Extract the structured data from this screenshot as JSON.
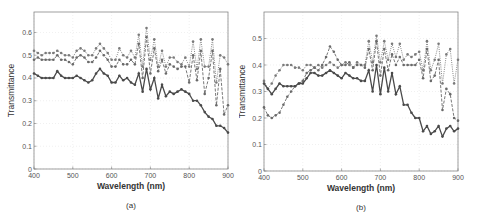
{
  "chart_data": [
    {
      "id": "a",
      "type": "line",
      "caption": "(a)",
      "title": "",
      "xlabel": "Wavelength (nm)",
      "ylabel": "Transmittance",
      "xlim": [
        400,
        900
      ],
      "ylim": [
        0,
        0.69
      ],
      "xticks": [
        400,
        500,
        600,
        700,
        800,
        900
      ],
      "yticks": [
        0,
        0.1,
        0.2,
        0.3,
        0.4,
        0.5,
        0.6
      ],
      "ytick_labels": [
        "0",
        "0.1",
        "0.2",
        "0.3",
        "0.4",
        "0.5",
        "0.6"
      ],
      "grid": true,
      "legend": null,
      "x": [
        400,
        410,
        420,
        430,
        440,
        450,
        460,
        470,
        480,
        490,
        500,
        510,
        520,
        530,
        540,
        550,
        560,
        570,
        580,
        590,
        600,
        610,
        620,
        630,
        640,
        650,
        660,
        670,
        680,
        690,
        700,
        710,
        720,
        730,
        740,
        750,
        760,
        770,
        780,
        790,
        800,
        810,
        820,
        830,
        840,
        850,
        860,
        870,
        880,
        890,
        900
      ],
      "series": [
        {
          "name": "series-1",
          "style": "dotted",
          "values": [
            0.52,
            0.51,
            0.5,
            0.51,
            0.51,
            0.51,
            0.52,
            0.51,
            0.5,
            0.5,
            0.49,
            0.52,
            0.53,
            0.52,
            0.5,
            0.5,
            0.53,
            0.55,
            0.53,
            0.51,
            0.48,
            0.48,
            0.53,
            0.5,
            0.49,
            0.52,
            0.49,
            0.59,
            0.45,
            0.62,
            0.48,
            0.57,
            0.45,
            0.52,
            0.45,
            0.49,
            0.49,
            0.47,
            0.46,
            0.49,
            0.45,
            0.56,
            0.44,
            0.57,
            0.45,
            0.45,
            0.57,
            0.38,
            0.5,
            0.49,
            0.46
          ]
        },
        {
          "name": "series-2",
          "style": "dashed",
          "values": [
            0.48,
            0.49,
            0.48,
            0.48,
            0.48,
            0.48,
            0.5,
            0.48,
            0.48,
            0.47,
            0.46,
            0.49,
            0.5,
            0.49,
            0.47,
            0.47,
            0.49,
            0.52,
            0.5,
            0.48,
            0.45,
            0.45,
            0.48,
            0.46,
            0.46,
            0.48,
            0.46,
            0.55,
            0.4,
            0.58,
            0.42,
            0.53,
            0.43,
            0.48,
            0.42,
            0.46,
            0.45,
            0.44,
            0.45,
            0.45,
            0.38,
            0.5,
            0.39,
            0.52,
            0.33,
            0.4,
            0.52,
            0.28,
            0.44,
            0.24,
            0.28
          ]
        },
        {
          "name": "series-3",
          "style": "solid",
          "values": [
            0.42,
            0.41,
            0.4,
            0.4,
            0.4,
            0.4,
            0.43,
            0.41,
            0.4,
            0.4,
            0.4,
            0.41,
            0.4,
            0.39,
            0.38,
            0.39,
            0.42,
            0.44,
            0.42,
            0.41,
            0.38,
            0.38,
            0.41,
            0.39,
            0.4,
            0.38,
            0.37,
            0.42,
            0.34,
            0.44,
            0.35,
            0.4,
            0.31,
            0.37,
            0.32,
            0.34,
            0.33,
            0.34,
            0.35,
            0.34,
            0.33,
            0.3,
            0.3,
            0.28,
            0.25,
            0.23,
            0.22,
            0.19,
            0.19,
            0.18,
            0.16
          ]
        }
      ]
    },
    {
      "id": "b",
      "type": "line",
      "caption": "(b)",
      "title": "",
      "xlabel": "Wavelength (nm)",
      "ylabel": "Transmittance",
      "xlim": [
        400,
        900
      ],
      "ylim": [
        0,
        0.6
      ],
      "xticks": [
        400,
        500,
        600,
        700,
        800,
        900
      ],
      "yticks": [
        0,
        0.1,
        0.2,
        0.3,
        0.4,
        0.5
      ],
      "ytick_labels": [
        "0",
        "0.1",
        "0.2",
        "0.3",
        "0.4",
        "0.5"
      ],
      "grid": true,
      "legend": null,
      "x": [
        400,
        410,
        420,
        430,
        440,
        450,
        460,
        470,
        480,
        490,
        500,
        510,
        520,
        530,
        540,
        550,
        560,
        570,
        580,
        590,
        600,
        610,
        620,
        630,
        640,
        650,
        660,
        670,
        680,
        690,
        700,
        710,
        720,
        730,
        740,
        750,
        760,
        770,
        780,
        790,
        800,
        810,
        820,
        830,
        840,
        850,
        860,
        870,
        880,
        890,
        900
      ],
      "series": [
        {
          "name": "series-1",
          "style": "dotted",
          "values": [
            0.34,
            0.31,
            0.33,
            0.36,
            0.38,
            0.4,
            0.4,
            0.4,
            0.39,
            0.39,
            0.38,
            0.4,
            0.4,
            0.39,
            0.4,
            0.39,
            0.4,
            0.41,
            0.4,
            0.39,
            0.4,
            0.41,
            0.4,
            0.39,
            0.41,
            0.4,
            0.4,
            0.49,
            0.41,
            0.51,
            0.41,
            0.49,
            0.42,
            0.48,
            0.43,
            0.48,
            0.42,
            0.44,
            0.43,
            0.44,
            0.45,
            0.38,
            0.49,
            0.38,
            0.42,
            0.48,
            0.33,
            0.44,
            0.46,
            0.33,
            0.42
          ]
        },
        {
          "name": "series-2",
          "style": "dashed",
          "values": [
            0.24,
            0.21,
            0.2,
            0.21,
            0.22,
            0.25,
            0.28,
            0.3,
            0.32,
            0.33,
            0.34,
            0.37,
            0.38,
            0.39,
            0.38,
            0.4,
            0.43,
            0.47,
            0.45,
            0.42,
            0.4,
            0.4,
            0.41,
            0.39,
            0.4,
            0.4,
            0.39,
            0.46,
            0.38,
            0.49,
            0.36,
            0.46,
            0.38,
            0.44,
            0.4,
            0.43,
            0.4,
            0.4,
            0.4,
            0.4,
            0.42,
            0.35,
            0.46,
            0.34,
            0.36,
            0.42,
            0.23,
            0.31,
            0.29,
            0.2,
            0.19
          ]
        },
        {
          "name": "series-3",
          "style": "solid",
          "values": [
            0.33,
            0.31,
            0.29,
            0.31,
            0.33,
            0.32,
            0.32,
            0.32,
            0.32,
            0.33,
            0.33,
            0.35,
            0.37,
            0.37,
            0.36,
            0.36,
            0.37,
            0.38,
            0.37,
            0.36,
            0.35,
            0.37,
            0.36,
            0.35,
            0.35,
            0.34,
            0.34,
            0.38,
            0.3,
            0.4,
            0.29,
            0.39,
            0.3,
            0.37,
            0.29,
            0.32,
            0.25,
            0.25,
            0.22,
            0.2,
            0.2,
            0.15,
            0.17,
            0.14,
            0.15,
            0.17,
            0.13,
            0.16,
            0.17,
            0.15,
            0.16
          ]
        }
      ]
    }
  ]
}
